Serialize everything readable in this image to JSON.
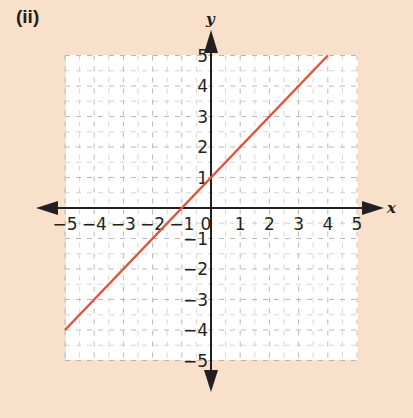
{
  "figure": {
    "label": "(ii)"
  },
  "colors": {
    "background": "#f8e0ca",
    "plot_area": "#ffffff",
    "grid": "#b8b8b8",
    "axis": "#231f20",
    "line": "#e0553a"
  },
  "chart_data": {
    "type": "line",
    "title": "(ii)",
    "xlabel": "x",
    "ylabel": "y",
    "xlim": [
      -5,
      5
    ],
    "ylim": [
      -5,
      5
    ],
    "grid": true,
    "grid_style": "dashed",
    "legend": null,
    "x_tick_labels": [
      "−5",
      "−4",
      "−3",
      "−2",
      "−1",
      "0",
      "1",
      "2",
      "3",
      "4",
      "5"
    ],
    "y_tick_labels": [
      "5",
      "4",
      "3",
      "2",
      "1",
      "−1",
      "−2",
      "−3",
      "−4",
      "−5"
    ],
    "series": [
      {
        "name": "y = x + 1",
        "x": [
          -5,
          4
        ],
        "y": [
          -4,
          5
        ],
        "color": "#e0553a"
      }
    ]
  }
}
